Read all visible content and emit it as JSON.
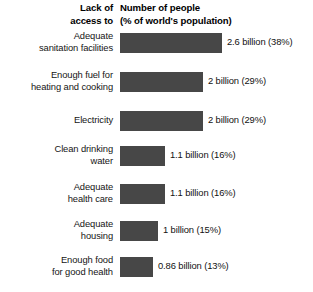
{
  "header": {
    "left_col_line1": "Lack of",
    "left_col_line2": "access to",
    "right_col_line1": "Number of people",
    "right_col_line2": "(% of world's population)"
  },
  "colors": {
    "bar": "#474747",
    "background": "#ffffff",
    "text": "#000000"
  },
  "chart_data": {
    "type": "bar",
    "orientation": "horizontal",
    "title": "",
    "xlabel": "Number of people (% of world's population)",
    "ylabel": "Lack of access to",
    "grid": false,
    "legend": null,
    "unit": "billion people",
    "xlim": [
      0,
      3
    ],
    "categories": [
      "Adequate sanitation facilities",
      "Enough fuel for heating and cooking",
      "Electricity",
      "Clean drinking water",
      "Adequate health care",
      "Adequate housing",
      "Enough food for good health"
    ],
    "values": [
      2.6,
      2,
      2,
      1.1,
      1.1,
      1,
      0.86
    ],
    "percentages": [
      38,
      29,
      29,
      16,
      16,
      15,
      13
    ],
    "data_labels": [
      "2.6 billion (38%)",
      "2 billion (29%)",
      "2 billion (29%)",
      "1.1 billion (16%)",
      "1.1 billion (16%)",
      "1 billion (15%)",
      "0.86 billion (13%)"
    ]
  },
  "rows": [
    {
      "label_line1": "Adequate",
      "label_line2": "sanitation facilities",
      "value": "2.6 billion (38%)",
      "bar_width": 102,
      "top": 30
    },
    {
      "label_line1": "Enough fuel for",
      "label_line2": "heating and cooking",
      "value": "2 billion (29%)",
      "bar_width": 83,
      "top": 69
    },
    {
      "label_line1": "Electricity",
      "label_line2": "",
      "value": "2 billion (29%)",
      "bar_width": 83,
      "top": 108
    },
    {
      "label_line1": "Clean drinking",
      "label_line2": "water",
      "value": "1.1 billion (16%)",
      "bar_width": 45,
      "top": 143
    },
    {
      "label_line1": "Adequate",
      "label_line2": "health care",
      "value": "1.1 billion (16%)",
      "bar_width": 45,
      "top": 181
    },
    {
      "label_line1": "Adequate",
      "label_line2": "housing",
      "value": "1 billion (15%)",
      "bar_width": 38,
      "top": 218
    },
    {
      "label_line1": "Enough food",
      "label_line2": "for good health",
      "value": "0.86 billion (13%)",
      "bar_width": 33,
      "top": 254
    }
  ]
}
